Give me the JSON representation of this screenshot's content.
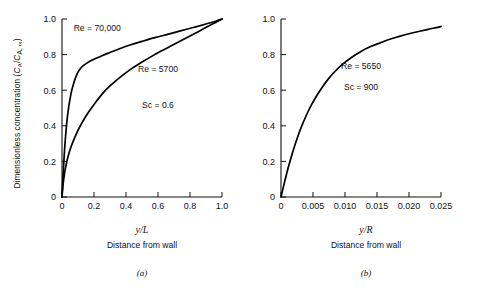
{
  "figure": {
    "shared_ylabel_prefix": "Dimensionless concentration (",
    "shared_ylabel_c1": "C",
    "shared_ylabel_sub1": "A",
    "shared_ylabel_slash": "/",
    "shared_ylabel_c2": "C",
    "shared_ylabel_sub2": "A, ∞",
    "shared_ylabel_suffix": ")",
    "shared_ylabel_full": "Dimensionless concentration (CA/CA,∞)"
  },
  "chart_data": [
    {
      "type": "line",
      "panel": "a",
      "caption": "(a)",
      "title": "",
      "xlabel": "y/L",
      "xlabel_sub": "Distance from wall",
      "ylabel": "Dimensionless concentration (CA/CA,∞)",
      "xlim": [
        0,
        1.0
      ],
      "ylim": [
        0,
        1.0
      ],
      "xticks": [
        0,
        0.2,
        0.4,
        0.6,
        0.8,
        1.0
      ],
      "xticklabels": [
        "0",
        "0.2",
        "0.4",
        "0.6",
        "0.8",
        "1.0"
      ],
      "yticks": [
        0,
        0.2,
        0.4,
        0.6,
        0.8,
        1.0
      ],
      "yticklabels": [
        "0",
        "0.2",
        "0.4",
        "0.6",
        "0.8",
        "1.0"
      ],
      "grid": false,
      "legend": "none",
      "annotations": [
        {
          "text": "Re = 70,000",
          "x": 0.22,
          "y": 0.93
        },
        {
          "text": "Re = 5700",
          "x": 0.6,
          "y": 0.7
        },
        {
          "text": "Sc = 0.6",
          "x": 0.6,
          "y": 0.5
        }
      ],
      "series": [
        {
          "name": "Re = 70,000",
          "x": [
            0,
            0.004,
            0.01,
            0.02,
            0.035,
            0.055,
            0.075,
            0.095,
            0.115,
            0.135,
            0.155,
            0.18,
            0.21,
            0.25,
            0.3,
            0.36,
            0.43,
            0.5,
            0.58,
            0.66,
            0.74,
            0.82,
            0.9,
            0.96,
            1.0
          ],
          "y": [
            0,
            0.075,
            0.175,
            0.315,
            0.46,
            0.575,
            0.645,
            0.693,
            0.722,
            0.74,
            0.752,
            0.765,
            0.778,
            0.794,
            0.812,
            0.833,
            0.855,
            0.874,
            0.895,
            0.914,
            0.933,
            0.952,
            0.972,
            0.987,
            1.0
          ]
        },
        {
          "name": "Re = 5700",
          "x": [
            0,
            0.004,
            0.01,
            0.02,
            0.035,
            0.055,
            0.08,
            0.11,
            0.15,
            0.2,
            0.26,
            0.32,
            0.38,
            0.44,
            0.5,
            0.56,
            0.62,
            0.68,
            0.74,
            0.8,
            0.86,
            0.92,
            0.965,
            1.0
          ],
          "y": [
            0,
            0.045,
            0.095,
            0.155,
            0.218,
            0.278,
            0.335,
            0.392,
            0.455,
            0.52,
            0.588,
            0.64,
            0.685,
            0.724,
            0.758,
            0.79,
            0.82,
            0.848,
            0.876,
            0.905,
            0.933,
            0.962,
            0.983,
            1.0
          ]
        }
      ]
    },
    {
      "type": "line",
      "panel": "b",
      "caption": "(b)",
      "title": "",
      "xlabel": "y/R",
      "xlabel_sub": "Distance from wall",
      "ylabel": "Dimensionless concentration (CA/CA,∞)",
      "xlim": [
        0,
        0.025
      ],
      "ylim": [
        0,
        1.0
      ],
      "xticks": [
        0,
        0.005,
        0.01,
        0.015,
        0.02,
        0.025
      ],
      "xticklabels": [
        "0",
        "0.005",
        "0.010",
        "0.015",
        "0.020",
        "0.025"
      ],
      "yticks": [
        0,
        0.2,
        0.4,
        0.6,
        0.8,
        1.0
      ],
      "yticklabels": [
        "0",
        "0.2",
        "0.4",
        "0.6",
        "0.8",
        "1.0"
      ],
      "grid": false,
      "legend": "none",
      "annotations": [
        {
          "text": "Re = 5650",
          "x": 0.0125,
          "y": 0.72
        },
        {
          "text": "Sc = 900",
          "x": 0.0125,
          "y": 0.6
        }
      ],
      "series": [
        {
          "name": "Re = 5650",
          "x": [
            0,
            0.0002,
            0.0005,
            0.001,
            0.0015,
            0.002,
            0.0026,
            0.0032,
            0.004,
            0.0048,
            0.0056,
            0.0065,
            0.0075,
            0.0085,
            0.0095,
            0.011,
            0.0125,
            0.014,
            0.0155,
            0.017,
            0.0185,
            0.02,
            0.0215,
            0.023,
            0.0245,
            0.025
          ],
          "y": [
            0,
            0.03,
            0.075,
            0.148,
            0.212,
            0.272,
            0.337,
            0.395,
            0.462,
            0.52,
            0.57,
            0.62,
            0.668,
            0.708,
            0.742,
            0.784,
            0.818,
            0.845,
            0.866,
            0.886,
            0.902,
            0.917,
            0.93,
            0.942,
            0.953,
            0.958
          ]
        }
      ]
    }
  ]
}
